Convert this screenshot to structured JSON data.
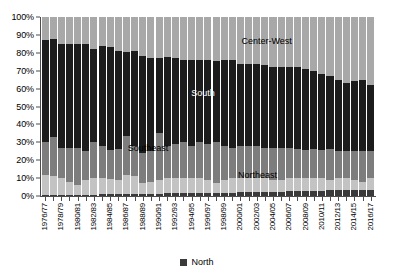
{
  "chart_data": {
    "type": "bar",
    "stacked": true,
    "normalized": "100%",
    "title": "",
    "subtitle": "",
    "xlabel": "",
    "ylabel": "",
    "ylim": [
      0,
      100
    ],
    "ytick_labels": [
      "100%",
      "90%",
      "80%",
      "70%",
      "60%",
      "50%",
      "40%",
      "30%",
      "20%",
      "10%",
      "0%"
    ],
    "ytick_values": [
      100,
      90,
      80,
      70,
      60,
      50,
      40,
      30,
      20,
      10,
      0
    ],
    "grid": false,
    "legend_position": "bottom",
    "legend": [
      "North"
    ],
    "categories": [
      "1976/77",
      "1977/78",
      "1978/79",
      "1979/80",
      "1980/81",
      "1981/82",
      "1982/83",
      "1983/84",
      "1984/85",
      "1985/86",
      "1986/87",
      "1987/88",
      "1988/89",
      "1989/90",
      "1990/91",
      "1991/92",
      "1992/93",
      "1993/94",
      "1994/95",
      "1995/96",
      "1996/97",
      "1997/98",
      "1998/99",
      "1999/00",
      "2000/01",
      "2001/02",
      "2002/03",
      "2003/04",
      "2004/05",
      "2005/06",
      "2006/07",
      "2007/08",
      "2008/09",
      "2009/10",
      "2010/11",
      "2011/12",
      "2012/13",
      "2013/14",
      "2014/15",
      "2015/16",
      "2016/17"
    ],
    "xtick_labels_shown": [
      "1976/77",
      "1978/79",
      "1980/81",
      "1982/83",
      "1984/85",
      "1986/87",
      "1988/89",
      "1990/91",
      "1992/93",
      "1994/95",
      "1996/97",
      "1998/99",
      "2000/01",
      "2002/03",
      "2004/05",
      "2006/07",
      "2008/09",
      "2010/11",
      "2012/13",
      "2014/15",
      "2016/17"
    ],
    "series": [
      {
        "name": "North",
        "color": "#3a3a3a",
        "order": 0,
        "values": [
          0.6,
          0.6,
          0.7,
          0.7,
          0.7,
          0.8,
          0.8,
          0.9,
          0.9,
          1.0,
          1.0,
          1.1,
          1.2,
          1.3,
          1.4,
          1.5,
          1.5,
          1.6,
          1.6,
          1.7,
          1.7,
          1.8,
          1.8,
          1.9,
          2.0,
          2.1,
          2.2,
          2.3,
          2.4,
          2.5,
          2.6,
          2.7,
          2.8,
          2.9,
          3.0,
          3.1,
          3.2,
          3.3,
          3.4,
          3.5,
          3.6
        ]
      },
      {
        "name": "Northeast",
        "color": "#c3c3c3",
        "order": 1,
        "values": [
          11.4,
          10.4,
          9.3,
          7.3,
          5.3,
          8.2,
          9.2,
          9.1,
          8.6,
          8.0,
          10.5,
          10.0,
          5.8,
          6.8,
          7.8,
          8.4,
          8.5,
          8.4,
          8.4,
          8.3,
          7.3,
          5.5,
          7.2,
          8.1,
          8.0,
          7.9,
          7.8,
          7.7,
          6.6,
          6.5,
          7.4,
          7.4,
          7.2,
          7.1,
          7.0,
          5.9,
          6.8,
          6.7,
          5.6,
          4.5,
          6.4
        ]
      },
      {
        "name": "Southeast",
        "color": "#7d7d7d",
        "order": 2,
        "values": [
          18.0,
          22.0,
          17.0,
          19.0,
          21.0,
          16.0,
          20.0,
          18.0,
          16.0,
          17.0,
          22.0,
          17.0,
          17.0,
          17.0,
          26.0,
          18.0,
          19.0,
          20.0,
          18.0,
          20.0,
          20.0,
          23.0,
          19.0,
          17.0,
          18.0,
          18.0,
          18.0,
          17.0,
          18.0,
          18.0,
          17.0,
          16.0,
          16.0,
          16.0,
          16.0,
          17.0,
          15.0,
          15.0,
          16.0,
          17.0,
          15.0
        ]
      },
      {
        "name": "South",
        "color": "#1c1c1c",
        "order": 3,
        "values": [
          57.0,
          55.0,
          58.0,
          58.0,
          58.0,
          60.0,
          52.0,
          56.0,
          58.0,
          55.0,
          47.0,
          53.0,
          54.0,
          52.0,
          42.0,
          50.0,
          48.0,
          46.0,
          48.0,
          46.0,
          47.0,
          45.0,
          48.0,
          49.0,
          46.0,
          46.0,
          46.0,
          46.0,
          45.0,
          45.0,
          45.0,
          46.0,
          45.0,
          44.0,
          42.0,
          41.0,
          40.0,
          38.0,
          39.0,
          40.0,
          37.0
        ]
      },
      {
        "name": "Center-West",
        "color": "#a8a8a8",
        "order": 4,
        "values": [
          13.0,
          12.0,
          15.0,
          15.0,
          15.0,
          15.0,
          18.0,
          16.0,
          16.5,
          19.0,
          19.5,
          18.9,
          22.0,
          22.9,
          22.8,
          22.1,
          23.0,
          24.0,
          24.0,
          24.0,
          24.0,
          24.7,
          24.0,
          24.0,
          26.0,
          26.0,
          26.0,
          27.0,
          28.0,
          28.0,
          28.0,
          27.9,
          29.0,
          30.0,
          32.0,
          33.0,
          35.0,
          37.0,
          36.0,
          35.0,
          38.0
        ]
      }
    ],
    "annotations": [
      {
        "text": "Center-West",
        "series": "Center-West",
        "color": "#000000"
      },
      {
        "text": "South",
        "series": "South",
        "color": "#ffffff"
      },
      {
        "text": "Southeast",
        "series": "Southeast",
        "color": "#000000"
      },
      {
        "text": "Northeast",
        "series": "Northeast",
        "color": "#000000"
      }
    ]
  },
  "legend": {
    "items": [
      {
        "label": "North",
        "color": "#3a3a3a"
      }
    ]
  }
}
